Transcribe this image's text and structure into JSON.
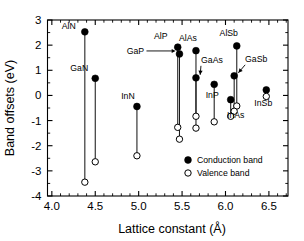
{
  "chart_data": {
    "type": "scatter",
    "title": "",
    "xlabel": "Lattice constant (Å)",
    "ylabel": "Band offsets (eV)",
    "xlim": [
      3.95,
      6.72
    ],
    "ylim": [
      -4,
      3
    ],
    "xticks": [
      4.0,
      4.5,
      5.0,
      5.5,
      6.0,
      6.5
    ],
    "xticklabels": [
      "4.0",
      "4.5",
      "5.0",
      "5.5",
      "6.0",
      "6.5"
    ],
    "yticks": [
      -4,
      -3,
      -2,
      -1,
      0,
      1,
      2,
      3
    ],
    "yticklabels": [
      "-4",
      "-3",
      "-2",
      "-1",
      "0",
      "1",
      "2",
      "3"
    ],
    "x_minor_step": 0.1,
    "y_minor_step": 0.5,
    "grid": false,
    "legend_position": "lower-right",
    "legend": [
      {
        "name": "Conduction band",
        "marker": "filled-circle"
      },
      {
        "name": "Valence band",
        "marker": "open-circle"
      }
    ],
    "series": [
      {
        "name": "Conduction band",
        "marker": "filled-circle",
        "color": "#000000"
      },
      {
        "name": "Valence band",
        "marker": "open-circle",
        "color": "#ffffff"
      }
    ],
    "points": [
      {
        "label": "AlN",
        "x": 4.38,
        "conduction": 2.53,
        "valence": -3.45,
        "label_dx": -16,
        "label_dy": -3,
        "anno": "none"
      },
      {
        "label": "GaN",
        "x": 4.5,
        "conduction": 0.68,
        "valence": -2.64,
        "label_dx": -16,
        "label_dy": -7,
        "anno": "none"
      },
      {
        "label": "InN",
        "x": 4.98,
        "conduction": -0.44,
        "valence": -2.4,
        "label_dx": -9,
        "label_dy": -7,
        "anno": "none"
      },
      {
        "label": "AlP",
        "x": 5.45,
        "conduction": 1.92,
        "valence": -1.27,
        "label_dx": -17,
        "label_dy": -8,
        "anno": "none"
      },
      {
        "label": "GaP",
        "x": 5.47,
        "conduction": 1.65,
        "valence": -1.74,
        "label_dx": -44,
        "label_dy": 0,
        "anno": "arrow-right"
      },
      {
        "label": "AlAs",
        "x": 5.66,
        "conduction": 1.78,
        "valence": -0.83,
        "label_dx": -8,
        "label_dy": -10,
        "anno": "none"
      },
      {
        "label": "GaAs",
        "x": 5.66,
        "conduction": 0.7,
        "valence": -1.3,
        "label_dx": 16,
        "label_dy": -15,
        "anno": "arrow-down-left"
      },
      {
        "label": "InP",
        "x": 5.87,
        "conduction": 0.44,
        "valence": -1.05,
        "label_dx": -2,
        "label_dy": 14,
        "anno": "none"
      },
      {
        "label": "AlSb",
        "x": 6.13,
        "conduction": 1.97,
        "valence": -0.42,
        "label_dx": -8,
        "label_dy": -10,
        "anno": "none"
      },
      {
        "label": "GaSb",
        "x": 6.1,
        "conduction": 0.78,
        "valence": -0.63,
        "label_dx": 22,
        "label_dy": -14,
        "anno": "arrow-down-left"
      },
      {
        "label": "InAs",
        "x": 6.06,
        "conduction": -0.17,
        "valence": -0.83,
        "label_dx": 5,
        "label_dy": 18,
        "anno": "none"
      },
      {
        "label": "InSb",
        "x": 6.47,
        "conduction": 0.22,
        "valence": -0.04,
        "label_dx": -3,
        "label_dy": 16,
        "anno": "none"
      }
    ]
  }
}
